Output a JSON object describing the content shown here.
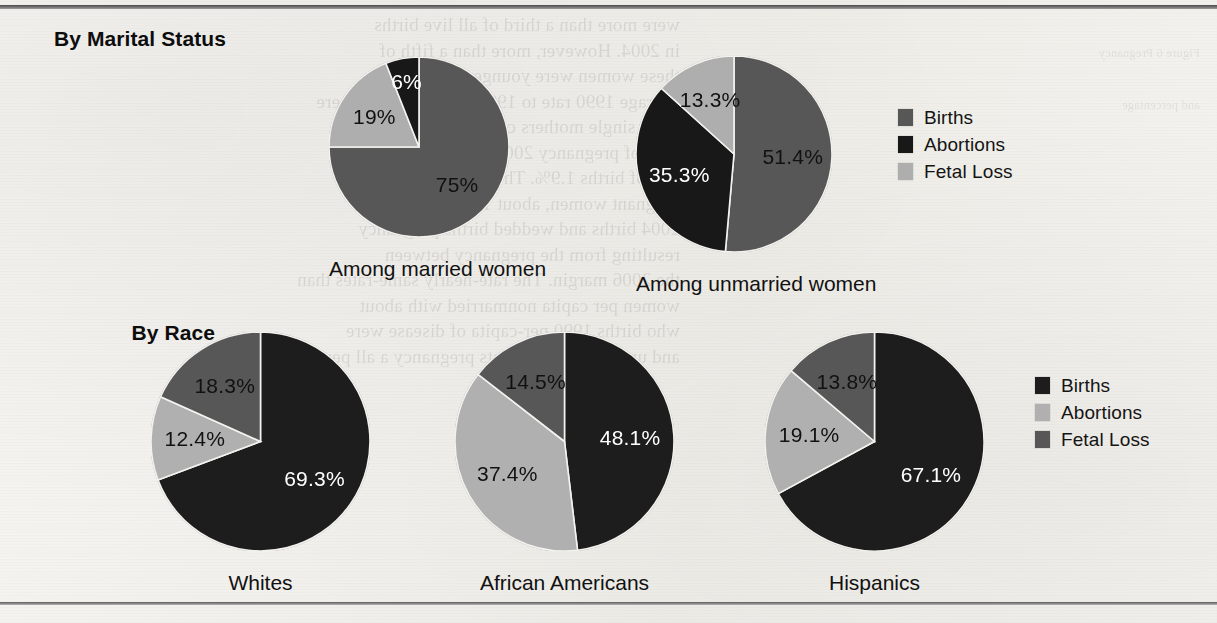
{
  "figure": {
    "sections": [
      {
        "title": "By Marital\nStatus"
      },
      {
        "title": "By Race"
      }
    ]
  },
  "colors": {
    "births_top": "#575757",
    "abortions_top": "#181818",
    "fetal_loss_top": "#aeaeae",
    "births_bottom": "#1d1d1d",
    "abortions_bottom": "#b0b0b0",
    "fetal_loss_bottom": "#575757",
    "paper": "#f4f2ee",
    "text": "#111111"
  },
  "legends": [
    {
      "name": "marital-status-legend",
      "items": [
        {
          "label": "Births",
          "color": "#575757"
        },
        {
          "label": "Abortions",
          "color": "#181818"
        },
        {
          "label": "Fetal Loss",
          "color": "#aeaeae"
        }
      ]
    },
    {
      "name": "race-legend",
      "items": [
        {
          "label": "Births",
          "color": "#1d1d1d"
        },
        {
          "label": "Abortions",
          "color": "#b0b0b0"
        },
        {
          "label": "Fetal Loss",
          "color": "#575757"
        }
      ]
    }
  ],
  "chart_data": [
    {
      "type": "pie",
      "title": "Among married women",
      "group": "By Marital Status",
      "categories": [
        "Births",
        "Fetal Loss",
        "Abortions"
      ],
      "values": [
        75,
        19,
        6
      ],
      "labels": [
        "75%",
        "19%",
        "6%"
      ],
      "colors": [
        "#575757",
        "#aeaeae",
        "#181818"
      ],
      "label_colors": [
        "dark",
        "dark",
        "light"
      ],
      "start_angle_deg": 0,
      "direction": "clockwise"
    },
    {
      "type": "pie",
      "title": "Among unmarried women",
      "group": "By Marital Status",
      "categories": [
        "Births",
        "Abortions",
        "Fetal Loss"
      ],
      "values": [
        51.4,
        35.3,
        13.3
      ],
      "labels": [
        "51.4%",
        "35.3%",
        "13.3%"
      ],
      "colors": [
        "#575757",
        "#181818",
        "#aeaeae"
      ],
      "label_colors": [
        "dark",
        "light",
        "dark"
      ],
      "start_angle_deg": 0,
      "direction": "clockwise"
    },
    {
      "type": "pie",
      "title": "Whites",
      "group": "By Race",
      "categories": [
        "Births",
        "Abortions",
        "Fetal Loss"
      ],
      "values": [
        69.3,
        12.4,
        18.3
      ],
      "labels": [
        "69.3%",
        "12.4%",
        "18.3%"
      ],
      "colors": [
        "#1d1d1d",
        "#b0b0b0",
        "#575757"
      ],
      "label_colors": [
        "light",
        "dark",
        "dark"
      ],
      "start_angle_deg": 0,
      "direction": "clockwise"
    },
    {
      "type": "pie",
      "title": "African Americans",
      "group": "By Race",
      "categories": [
        "Births",
        "Abortions",
        "Fetal Loss"
      ],
      "values": [
        48.1,
        37.4,
        14.5
      ],
      "labels": [
        "48.1%",
        "37.4%",
        "14.5%"
      ],
      "colors": [
        "#1d1d1d",
        "#b0b0b0",
        "#575757"
      ],
      "label_colors": [
        "light",
        "dark",
        "dark"
      ],
      "start_angle_deg": 0,
      "direction": "clockwise"
    },
    {
      "type": "pie",
      "title": "Hispanics",
      "group": "By Race",
      "categories": [
        "Births",
        "Abortions",
        "Fetal Loss"
      ],
      "values": [
        67.1,
        19.1,
        13.8
      ],
      "labels": [
        "67.1%",
        "19.1%",
        "13.8%"
      ],
      "colors": [
        "#1d1d1d",
        "#b0b0b0",
        "#575757"
      ],
      "label_colors": [
        "light",
        "dark",
        "dark"
      ],
      "start_angle_deg": 0,
      "direction": "clockwise"
    }
  ],
  "background_text": {
    "left_column": "were more than a third of all live births\nin 2004. However, more than a fifth of\nthese women were younger than 20,\naverage 1990 rate to 1995 rate surging in there\nmore single mothers can be identi\nfiers of pregnancy 2006, the birth per-\nrate of births 1.9%. The next rate 14.2\npregnant women, about 19 years old, the\n2004 births and wedded births pregnancy\nresulting from the pregnancy between\nthe 2006 margin. The rate-nearly same-rates than\nwomen per capita nonmarried with about\nwho births 1990 per-capita of disease were\nand unmarried age counts pregnancy a all per",
    "right_column": "Figure 6 Pregnancy\n\nand percentage"
  }
}
